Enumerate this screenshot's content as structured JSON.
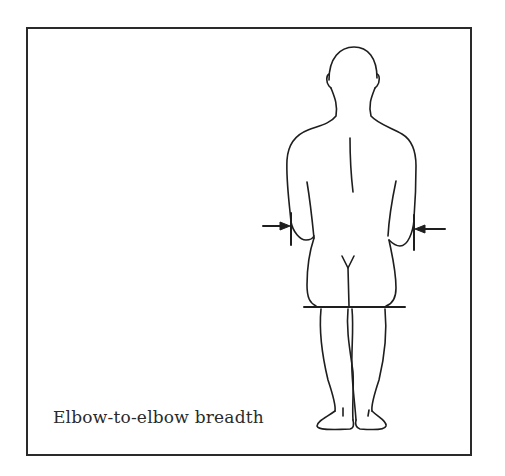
{
  "figure": {
    "caption": "Elbow-to-elbow breadth",
    "measurement": {
      "name": "Elbow-to-elbow breadth",
      "markers": [
        {
          "side": "left",
          "icon": "arrow-right-icon"
        },
        {
          "side": "right",
          "icon": "arrow-left-icon"
        }
      ]
    },
    "colors": {
      "line": "#1e1e1e",
      "frame": "#2a2a2a",
      "background": "#ffffff"
    }
  }
}
